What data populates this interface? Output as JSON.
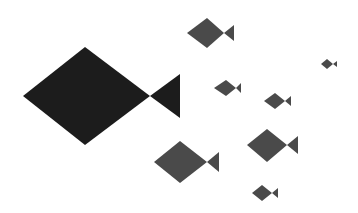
{
  "canvas": {
    "width": 358,
    "height": 213,
    "background": "#ffffff"
  },
  "colors": {
    "leader": "#1c1c1c",
    "school": "#4a4a4a"
  },
  "fish": [
    {
      "id": "leader",
      "color": "leader",
      "body": [
        [
          23,
          96
        ],
        [
          85,
          47
        ],
        [
          150,
          96
        ],
        [
          85,
          145
        ]
      ],
      "tail": [
        [
          150,
          96
        ],
        [
          180,
          74
        ],
        [
          180,
          118
        ]
      ]
    },
    {
      "id": "fish-a",
      "color": "school",
      "body": [
        [
          187,
          33
        ],
        [
          207,
          18
        ],
        [
          224,
          33
        ],
        [
          207,
          48
        ]
      ],
      "tail": [
        [
          224,
          33
        ],
        [
          234,
          25
        ],
        [
          234,
          41
        ]
      ]
    },
    {
      "id": "fish-b",
      "color": "school",
      "body": [
        [
          214,
          88
        ],
        [
          226,
          80
        ],
        [
          236,
          88
        ],
        [
          226,
          96
        ]
      ],
      "tail": [
        [
          236,
          88
        ],
        [
          241,
          83
        ],
        [
          241,
          93
        ]
      ]
    },
    {
      "id": "fish-c",
      "color": "school",
      "body": [
        [
          264,
          101
        ],
        [
          275,
          93
        ],
        [
          285,
          101
        ],
        [
          275,
          109
        ]
      ],
      "tail": [
        [
          285,
          101
        ],
        [
          291,
          96
        ],
        [
          291,
          106
        ]
      ]
    },
    {
      "id": "fish-d",
      "color": "school",
      "body": [
        [
          321,
          64
        ],
        [
          327,
          59
        ],
        [
          333,
          64
        ],
        [
          327,
          69
        ]
      ],
      "tail": [
        [
          333,
          64
        ],
        [
          337,
          61
        ],
        [
          337,
          67
        ]
      ]
    },
    {
      "id": "fish-e",
      "color": "school",
      "body": [
        [
          154,
          162
        ],
        [
          180,
          141
        ],
        [
          207,
          162
        ],
        [
          180,
          183
        ]
      ],
      "tail": [
        [
          207,
          162
        ],
        [
          219,
          152
        ],
        [
          219,
          172
        ]
      ]
    },
    {
      "id": "fish-f",
      "color": "school",
      "body": [
        [
          247,
          145
        ],
        [
          267,
          129
        ],
        [
          287,
          145
        ],
        [
          267,
          162
        ]
      ],
      "tail": [
        [
          287,
          145
        ],
        [
          298,
          136
        ],
        [
          298,
          154
        ]
      ]
    },
    {
      "id": "fish-g",
      "color": "school",
      "body": [
        [
          252,
          193
        ],
        [
          262,
          185
        ],
        [
          272,
          193
        ],
        [
          262,
          201
        ]
      ],
      "tail": [
        [
          272,
          193
        ],
        [
          278,
          188
        ],
        [
          278,
          198
        ]
      ]
    }
  ]
}
